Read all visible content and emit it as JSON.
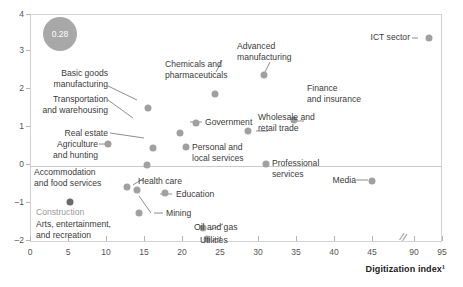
{
  "chart_data": {
    "type": "scatter",
    "title": "",
    "xlabel": "Digitization index¹",
    "ylabel": "",
    "xlim": [
      0,
      95
    ],
    "ylim": [
      -2,
      4
    ],
    "xticks": [
      0,
      5,
      10,
      15,
      20,
      25,
      30,
      35,
      40,
      45,
      90,
      95
    ],
    "yticks": [
      -2,
      -1,
      0,
      1,
      2,
      3,
      4
    ],
    "axis_break": {
      "after": 45,
      "before": 90,
      "symbol": "//"
    },
    "grid": false,
    "legend": null,
    "bubble_annotation": {
      "label": "0.28",
      "x": 5.5,
      "y": 3.45
    },
    "points": [
      {
        "label": "ICT sector",
        "x": 92.0,
        "y": 3.5
      },
      {
        "label": "Advanced\nmanufacturing",
        "x": 30.3,
        "y": 2.42
      },
      {
        "label": "Chemicals and\npharmaceuticals",
        "x": 21.3,
        "y": 1.93
      },
      {
        "label": "Finance\nand insurance",
        "x": 34.7,
        "y": 1.52
      },
      {
        "label": "Basic goods\nmanufacturing",
        "x": 15.6,
        "y": 1.46
      },
      {
        "label": "Wholesale and\nretail trade",
        "x": 28.7,
        "y": 1.17
      },
      {
        "label": "Government",
        "x": 17.8,
        "y": 1.07
      },
      {
        "label": "Transportation\nand warehousing",
        "x": 17.3,
        "y": 0.8
      },
      {
        "label": "Agriculture\nand hunting",
        "x": 10.4,
        "y": 0.55
      },
      {
        "label": "Personal and\nlocal services",
        "x": 19.9,
        "y": 0.44
      },
      {
        "label": "Real estate",
        "x": 15.4,
        "y": 0.42
      },
      {
        "label": "Professional\nservices",
        "x": 31.0,
        "y": 0.02
      },
      {
        "label": "Health care",
        "x": 15.3,
        "y": 0.0
      },
      {
        "label": "Media",
        "x": 45.0,
        "y": -0.34
      },
      {
        "label": "Accommodation\nand food services",
        "x": 12.6,
        "y": -0.6
      },
      {
        "label": "Education",
        "x": 16.8,
        "y": -0.72
      },
      {
        "label": "Construction",
        "x": 5.5,
        "y": -0.76,
        "dark": true
      },
      {
        "label": "Arts, entertainment,\nand recreation",
        "x": 14.2,
        "y": -0.65
      },
      {
        "label": "Mining",
        "x": 14.3,
        "y": -1.28
      },
      {
        "label": "Oil and gas",
        "x": 20.0,
        "y": -1.66
      },
      {
        "label": "Utilities",
        "x": 20.5,
        "y": -1.86
      }
    ]
  },
  "axis": {
    "x_title": "Digitization index¹",
    "x_labels": [
      "0",
      "5",
      "10",
      "15",
      "20",
      "25",
      "30",
      "35",
      "40",
      "45",
      "90",
      "95"
    ],
    "y_labels": [
      "4",
      "3",
      "2",
      "1",
      "0",
      "–1",
      "–2"
    ],
    "break_symbol": "//"
  },
  "labels": {
    "ict_sector": "ICT sector",
    "advanced_manufacturing": "Advanced\nmanufacturing",
    "chemicals": "Chemicals and\npharmaceuticals",
    "finance": "Finance\nand insurance",
    "basic_goods": "Basic goods\nmanufacturing",
    "wholesale": "Wholesale and\nretail trade",
    "government": "Government",
    "transportation": "Transportation\nand warehousing",
    "agriculture": "Agriculture\nand hunting",
    "personal_services": "Personal and\nlocal services",
    "real_estate": "Real estate",
    "professional_services": "Professional\nservices",
    "health_care": "Health care",
    "media": "Media",
    "accommodation": "Accommodation\nand food services",
    "education": "Education",
    "construction": "Construction",
    "arts": "Arts, entertainment,\nand recreation",
    "mining": "Mining",
    "oil_gas": "Oil and gas",
    "utilities": "Utilities",
    "bubble_value": "0.28"
  },
  "colors": {
    "marker": "#a0a0a0",
    "marker_dark": "#6b6b6b",
    "bubble": "#a8a8a8",
    "text": "#3b3b3b",
    "muted_text": "#9a9a9a",
    "axis": "#b5b5b5",
    "frame": "#d2d2d2"
  }
}
